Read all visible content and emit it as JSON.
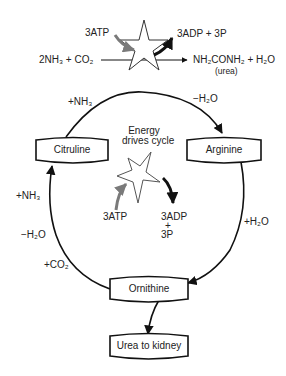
{
  "top_reaction": {
    "atp_label": "3ATP",
    "adp_label": "3ADP + 3P",
    "reactants": "2NH₃ + CO₂",
    "products": "NH₂CONH₂ + H₂O",
    "product_note": "(urea)"
  },
  "cycle": {
    "nodes": {
      "citruline": "Citruline",
      "arginine": "Arginine",
      "ornithine": "Ornithine",
      "urea_to_kidney": "Urea to kidney"
    },
    "edge_labels": {
      "citruline_to_arginine": "+NH₃",
      "arginine_entry": "−H₂O",
      "arginine_to_ornithine": "+H₂O",
      "ornithine_to_citruline_nh3": "+NH₃",
      "ornithine_to_citruline_h2o": "−H₂O",
      "ornithine_to_citruline_co2": "+CO₂"
    },
    "center": {
      "caption_line1": "Energy",
      "caption_line2": "drives cycle",
      "atp_label": "3ATP",
      "adp_line1": "3ADP",
      "adp_line2": "+",
      "adp_line3": "3P"
    }
  },
  "colors": {
    "line": "#111111",
    "atp_arrow": "#7a7a7a",
    "adp_arrow": "#111111"
  }
}
